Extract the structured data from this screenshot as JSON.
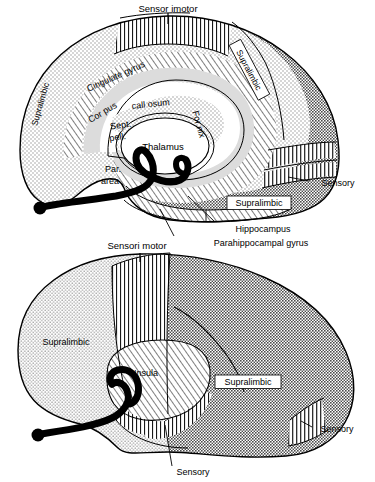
{
  "figure": {
    "background_color": "#ffffff",
    "ink_color": "#000000"
  },
  "patterns": {
    "stipple_light": {
      "name": "light-stipple",
      "color": "#cfcfcf"
    },
    "stipple_dark": {
      "name": "dark-checker",
      "color": "#808080"
    },
    "hatch_diagonal": {
      "name": "diagonal-hatch",
      "color": "#000000"
    },
    "hatch_vertical": {
      "name": "vertical-line-hatch",
      "color": "#000000"
    },
    "solid_black": {
      "name": "solid-black",
      "color": "#000000"
    },
    "white": {
      "name": "plain-white",
      "color": "#ffffff"
    }
  },
  "panels": [
    {
      "id": "medial",
      "name": "medial-surface-view",
      "labels": [
        {
          "id": "m-sensorimotor",
          "text": "Sensor imotor",
          "x": 168,
          "y": 12,
          "rotate": 0,
          "anchor": "middle",
          "size": 9.5,
          "boxed": false
        },
        {
          "id": "m-supralimbic-left",
          "text": "Supralimbic",
          "x": 43,
          "y": 105,
          "rotate": -74,
          "anchor": "middle",
          "size": 8.5,
          "boxed": false
        },
        {
          "id": "m-supralimbic-right",
          "text": "Supralimbic",
          "x": 249,
          "y": 70,
          "rotate": 62,
          "anchor": "middle",
          "size": 8.5,
          "boxed": true
        },
        {
          "id": "m-cingulate",
          "text": "Cingulate  gyrus",
          "x": 117,
          "y": 79,
          "rotate": -24,
          "anchor": "middle",
          "size": 9,
          "boxed": false
        },
        {
          "id": "m-corpus",
          "text": "Cor pus",
          "x": 104,
          "y": 115,
          "rotate": -31,
          "anchor": "middle",
          "size": 9,
          "boxed": false
        },
        {
          "id": "m-callosum",
          "text": "call osum",
          "x": 151,
          "y": 107,
          "rotate": -6,
          "anchor": "middle",
          "size": 9,
          "boxed": false
        },
        {
          "id": "m-fornix",
          "text": "For nix",
          "x": 196,
          "y": 125,
          "rotate": 74,
          "anchor": "middle",
          "size": 9,
          "boxed": false
        },
        {
          "id": "m-sept",
          "text": "Sept.",
          "x": 121,
          "y": 128,
          "rotate": -8,
          "anchor": "middle",
          "size": 9,
          "boxed": false
        },
        {
          "id": "m-pell",
          "text": "pell.",
          "x": 118,
          "y": 140,
          "rotate": -8,
          "anchor": "middle",
          "size": 9,
          "boxed": false
        },
        {
          "id": "m-thalamus",
          "text": "Thalamus",
          "x": 163,
          "y": 146,
          "rotate": 0,
          "anchor": "middle",
          "size": 9.5,
          "boxed": false
        },
        {
          "id": "m-par",
          "text": "Par.",
          "x": 113,
          "y": 172,
          "rotate": 0,
          "anchor": "middle",
          "size": 9,
          "boxed": false
        },
        {
          "id": "m-area",
          "text": "area",
          "x": 110,
          "y": 184,
          "rotate": 0,
          "anchor": "middle",
          "size": 9,
          "boxed": false
        },
        {
          "id": "m-supralimbic-temporal",
          "text": "Supralimbic",
          "x": 259,
          "y": 203,
          "rotate": 0,
          "anchor": "middle",
          "size": 9,
          "boxed": true
        },
        {
          "id": "m-sensory",
          "text": "Sensory",
          "x": 338,
          "y": 183,
          "rotate": 0,
          "anchor": "middle",
          "size": 9,
          "boxed": false
        },
        {
          "id": "m-hippocampus",
          "text": "Hippocampus",
          "x": 263,
          "y": 229,
          "rotate": 0,
          "anchor": "middle",
          "size": 9,
          "boxed": false
        },
        {
          "id": "m-parahippocampal",
          "text": "Parahippocampal  gyrus",
          "x": 261,
          "y": 243,
          "rotate": 0,
          "anchor": "middle",
          "size": 9,
          "boxed": false
        }
      ],
      "leaders": [
        {
          "id": "leader-hippocampus",
          "from": [
            215,
            222
          ],
          "to": [
            188,
            196
          ]
        },
        {
          "id": "leader-parahippocampal",
          "from": [
            174,
            236
          ],
          "to": [
            160,
            209
          ]
        },
        {
          "id": "leader-sensory",
          "from": [
            309,
            181
          ],
          "to": [
            288,
            177
          ]
        }
      ]
    },
    {
      "id": "lateral",
      "name": "lateral-surface-view",
      "labels": [
        {
          "id": "l-sensorimotor",
          "text": "Sensori motor",
          "x": 137,
          "y": 249,
          "rotate": 0,
          "anchor": "middle",
          "size": 9.5,
          "boxed": false
        },
        {
          "id": "l-supralimbic-left",
          "text": "Supralimbic",
          "x": 66,
          "y": 342,
          "rotate": 0,
          "anchor": "middle",
          "size": 9,
          "boxed": false
        },
        {
          "id": "l-insula",
          "text": "Insula",
          "x": 146,
          "y": 373,
          "rotate": 0,
          "anchor": "middle",
          "size": 9,
          "boxed": false
        },
        {
          "id": "l-supralimbic-right",
          "text": "Supralimbic",
          "x": 248,
          "y": 382,
          "rotate": 0,
          "anchor": "middle",
          "size": 9,
          "boxed": true
        },
        {
          "id": "l-sensory-right",
          "text": "Sensory",
          "x": 337,
          "y": 429,
          "rotate": 0,
          "anchor": "middle",
          "size": 9,
          "boxed": false
        },
        {
          "id": "l-sensory-bottom",
          "text": "Sensory",
          "x": 193,
          "y": 472,
          "rotate": 0,
          "anchor": "middle",
          "size": 9,
          "boxed": false
        }
      ],
      "leaders": [
        {
          "id": "leader-sensory-bottom",
          "from": [
            172,
            466
          ],
          "to": [
            165,
            425
          ]
        },
        {
          "id": "leader-sensory-right",
          "from": [
            312,
            427
          ],
          "to": [
            301,
            421
          ]
        }
      ]
    }
  ]
}
